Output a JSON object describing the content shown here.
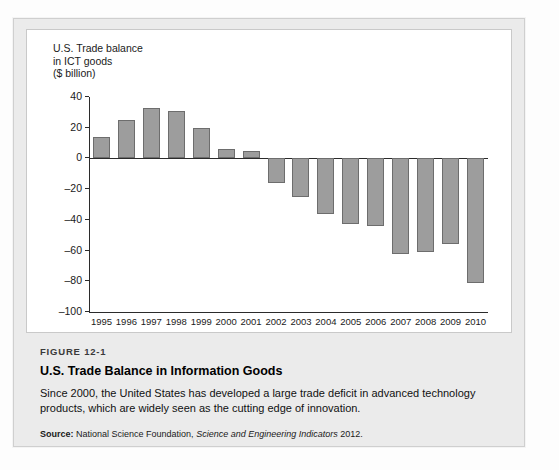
{
  "chart_data": {
    "type": "bar",
    "title": "U.S. Trade balance\nin ICT goods\n($ billion)",
    "xlabel": "",
    "ylabel": "U.S. Trade balance in ICT goods ($ billion)",
    "ylim": [
      -100,
      40
    ],
    "yticks": [
      40,
      20,
      0,
      -20,
      -40,
      -60,
      -80,
      -100
    ],
    "ytick_labels": [
      "40",
      "20",
      "0",
      "–20",
      "–40",
      "–60",
      "–80",
      "–100"
    ],
    "grid": false,
    "legend": null,
    "categories": [
      "1995",
      "1996",
      "1997",
      "1998",
      "1999",
      "2000",
      "2001",
      "2002",
      "2003",
      "2004",
      "2005",
      "2006",
      "2007",
      "2008",
      "2009",
      "2010"
    ],
    "values": [
      14,
      25,
      33,
      31,
      20,
      6,
      5,
      -16,
      -25,
      -36,
      -43,
      -44,
      -62,
      -61,
      -56,
      -81
    ],
    "bar_color": "#9d9d9d",
    "bar_edge_color": "#6d6d6d",
    "axis_color": "#2b2b2b"
  },
  "figure": {
    "number": "FIGURE 12-1",
    "title": "U.S. Trade Balance in Information Goods",
    "body": "Since 2000, the United States has developed a large trade deficit in advanced technology products, which are widely seen as the cutting edge of innovation.",
    "source_label": "Source:",
    "source_text_before": "National Science Foundation,",
    "source_italic": "Science and Engineering Indicators",
    "source_text_after": "2012."
  }
}
